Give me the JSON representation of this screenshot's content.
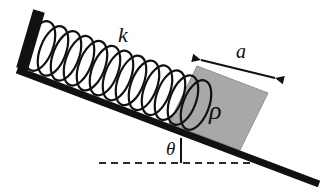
{
  "figure": {
    "type": "physics-diagram",
    "background_color": "#ffffff",
    "labels": {
      "spring_constant": "k",
      "block_width": "a",
      "block_density": "ρ",
      "incline_angle": "θ"
    },
    "colors": {
      "ink": "#111111",
      "block_fill": "#a8a8a8",
      "block_stroke": "#8f8f8f",
      "dashed_line": "#2b2b2b"
    },
    "geometry": {
      "incline": {
        "x1": 17,
        "y1": 70,
        "x2": 319,
        "y2": 184,
        "stroke_width": 7,
        "angle_degrees": 20.7
      },
      "wall": {
        "x1": 39,
        "y1": 11,
        "x2": 22,
        "y2": 69,
        "stroke_width": 12
      },
      "dashed_baseline": {
        "x1": 99,
        "y1": 163,
        "x2": 252,
        "y2": 163,
        "dash_pattern": "7 5"
      },
      "spring": {
        "start_x": 40,
        "start_y": 46,
        "end_x": 196,
        "end_y": 105,
        "coil_count": 13,
        "coil_rx": 13,
        "coil_ry": 26,
        "stroke_width": 2.2
      },
      "block": {
        "corners": "197,66 268,93 240,150 169,123",
        "fill": "#a8a8a8"
      },
      "dimension_arrow": {
        "x1": 201,
        "y1": 60,
        "x2": 275,
        "y2": 78,
        "double_headed": true
      }
    },
    "label_positions": {
      "k": {
        "x": 118,
        "y": 42
      },
      "a": {
        "x": 236,
        "y": 58
      },
      "rho": {
        "x": 209,
        "y": 119
      },
      "theta": {
        "x": 166,
        "y": 155
      }
    }
  }
}
